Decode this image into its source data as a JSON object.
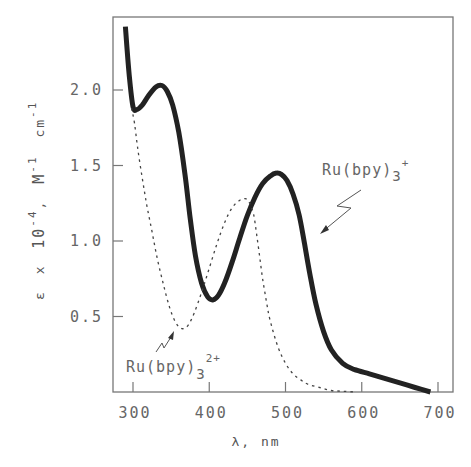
{
  "chart_data": {
    "type": "line",
    "title": "",
    "xlabel": "λ, nm",
    "ylabel": "ε x 10⁻⁴, M⁻¹ cm⁻¹",
    "xlim": [
      282,
      720
    ],
    "ylim": [
      0,
      2.5
    ],
    "x_ticks": [
      300,
      400,
      500,
      600,
      700
    ],
    "x_tick_labels": [
      "300",
      "400",
      "500",
      "600",
      "700"
    ],
    "y_ticks": [
      0.5,
      1.0,
      1.5,
      2.0
    ],
    "y_tick_labels": [
      "0.5",
      "1.0",
      "1.5",
      "2.0"
    ],
    "grid": false,
    "legend": "none (inline annotations)",
    "series": [
      {
        "name": "Ru(bpy)3+",
        "style": "solid-thick",
        "color": "#222222",
        "x": [
          290,
          295,
          300,
          305,
          312,
          320,
          330,
          338,
          345,
          352,
          360,
          368,
          375,
          382,
          390,
          398,
          405,
          412,
          420,
          430,
          440,
          450,
          460,
          470,
          480,
          488,
          495,
          502,
          510,
          518,
          525,
          532,
          540,
          550,
          560,
          575,
          590,
          610,
          630,
          650,
          670,
          690
        ],
        "values": [
          2.42,
          2.1,
          1.89,
          1.87,
          1.9,
          1.96,
          2.02,
          2.03,
          1.99,
          1.9,
          1.72,
          1.45,
          1.15,
          0.9,
          0.72,
          0.63,
          0.61,
          0.64,
          0.72,
          0.86,
          1.02,
          1.17,
          1.29,
          1.38,
          1.43,
          1.45,
          1.44,
          1.4,
          1.31,
          1.17,
          0.98,
          0.78,
          0.58,
          0.4,
          0.28,
          0.19,
          0.15,
          0.12,
          0.09,
          0.06,
          0.03,
          0.0
        ]
      },
      {
        "name": "Ru(bpy)3 2+",
        "style": "dotted",
        "color": "#444444",
        "x": [
          298,
          302,
          306,
          312,
          318,
          325,
          332,
          340,
          348,
          356,
          364,
          372,
          380,
          390,
          400,
          410,
          420,
          430,
          440,
          447,
          452,
          458,
          462,
          466,
          470,
          475,
          480,
          490,
          500,
          510,
          520,
          530,
          545,
          560,
          575,
          590
        ],
        "values": [
          1.88,
          1.78,
          1.62,
          1.42,
          1.24,
          1.06,
          0.88,
          0.71,
          0.56,
          0.46,
          0.42,
          0.44,
          0.52,
          0.66,
          0.82,
          0.98,
          1.12,
          1.22,
          1.27,
          1.28,
          1.26,
          1.18,
          1.05,
          0.9,
          0.75,
          0.6,
          0.47,
          0.3,
          0.19,
          0.12,
          0.08,
          0.05,
          0.03,
          0.01,
          0.005,
          0.0
        ]
      }
    ],
    "annotations": [
      {
        "text_main": "Ru(bpy)",
        "sub": "3",
        "sup": "+",
        "target_series": "Ru(bpy)3+"
      },
      {
        "text_main": "Ru(bpy)",
        "sub": "3",
        "sup": "2+",
        "target_series": "Ru(bpy)3 2+"
      }
    ]
  },
  "axes": {
    "xlabel": "λ, nm",
    "ylabel_parts": {
      "eps": "ε",
      "x": "x",
      "ten": "10",
      "exp": "-4",
      "comma": ",",
      "M": "M",
      "Mexp": "-1",
      "cm": "cm",
      "cmexp": "-1"
    }
  },
  "labels": {
    "ru3plus": {
      "main": "Ru(bpy)",
      "sub": "3",
      "sup": "+"
    },
    "ru2plus": {
      "main": "Ru(bpy)",
      "sub": "3",
      "sup": "2+"
    }
  }
}
